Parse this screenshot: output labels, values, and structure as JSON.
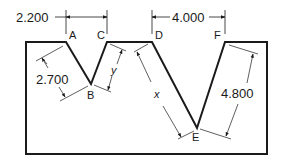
{
  "diagram": {
    "type": "technical-drawing",
    "points": [
      {
        "label": "A",
        "x": 66,
        "y": 42
      },
      {
        "label": "B",
        "x": 91,
        "y": 84
      },
      {
        "label": "C",
        "x": 107,
        "y": 42
      },
      {
        "label": "D",
        "x": 152,
        "y": 42
      },
      {
        "label": "E",
        "x": 197,
        "y": 128
      },
      {
        "label": "F",
        "x": 225,
        "y": 42
      }
    ],
    "dimensions": {
      "ac": "2.200",
      "df": "4.000",
      "ab": "2.700",
      "ef": "4.800",
      "bc": "y",
      "de": "x"
    },
    "colors": {
      "line": "#1a1a1a",
      "background": "#ffffff"
    }
  }
}
